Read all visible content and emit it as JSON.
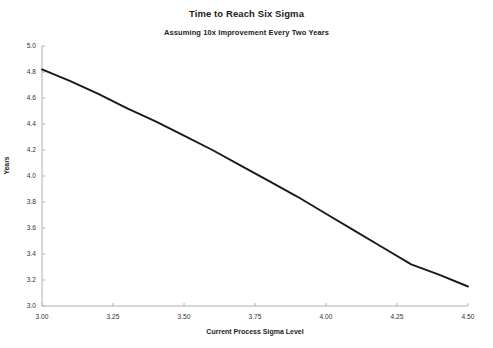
{
  "chart_data": {
    "type": "line",
    "title": "Time to Reach Six Sigma",
    "subtitle": "Assuming 10x Improvement Every Two Years",
    "xlabel": "Current Process Sigma Level",
    "ylabel": "Years",
    "xlim": [
      3.0,
      4.5
    ],
    "ylim": [
      3.0,
      5.0
    ],
    "grid": false,
    "legend": null,
    "line_color": "#1a1a1a",
    "axis_color": "#b0b0b0",
    "background": "#ffffff",
    "xticks": [
      3.0,
      3.25,
      3.5,
      3.75,
      4.0,
      4.25,
      4.5
    ],
    "xtick_labels": [
      "3.00",
      "3.25",
      "3.50",
      "3.75",
      "4.00",
      "4.25",
      "4.50"
    ],
    "yticks": [
      3.0,
      3.2,
      3.4,
      3.6,
      3.8,
      4.0,
      4.2,
      4.4,
      4.6,
      4.8,
      5.0
    ],
    "ytick_labels": [
      "3.0",
      "3.2",
      "3.4",
      "3.6",
      "3.8",
      "4.0",
      "4.2",
      "4.4",
      "4.6",
      "4.8",
      "5.0"
    ],
    "series": [
      {
        "name": "Years to Six Sigma",
        "x": [
          3.0,
          3.1,
          3.2,
          3.3,
          3.4,
          3.5,
          3.6,
          3.7,
          3.8,
          3.9,
          4.0,
          4.1,
          4.2,
          4.3,
          4.4,
          4.5
        ],
        "y": [
          4.82,
          4.73,
          4.63,
          4.52,
          4.42,
          4.31,
          4.2,
          4.08,
          3.96,
          3.84,
          3.71,
          3.58,
          3.45,
          3.32,
          3.24,
          3.15
        ]
      }
    ]
  }
}
